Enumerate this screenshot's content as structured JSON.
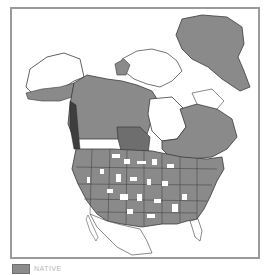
{
  "map": {
    "title": "",
    "region": "North America",
    "colors": {
      "present": "#8a8a8a",
      "present_dark": "#6e6e6e",
      "absent": "#ffffff",
      "border": "#3a3a3a",
      "frame": "#9a9a9a"
    }
  },
  "legend": {
    "items": [
      {
        "label": "NATIVE",
        "color": "#8c8c8c"
      }
    ]
  }
}
